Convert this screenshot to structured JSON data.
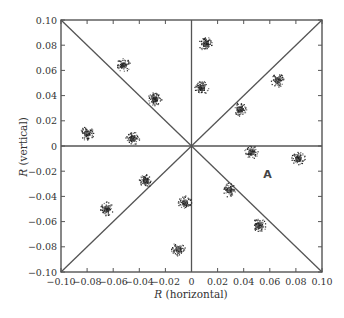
{
  "chart_data": {
    "type": "scatter",
    "title": "",
    "xlabel": "R (horizontal)",
    "ylabel": "R (vertical)",
    "xlabel_var": "R",
    "xlabel_rest": " (horizontal)",
    "ylabel_var": "R",
    "ylabel_rest": " (vertical)",
    "xlim": [
      -0.1,
      0.1
    ],
    "ylim": [
      -0.1,
      0.1
    ],
    "grid": false,
    "legend": null,
    "x_ticks": [
      "-0.10",
      "-0.08",
      "-0.06",
      "-0.04",
      "-0.02",
      "0",
      "0.02",
      "0.04",
      "0.06",
      "0.08",
      "0.10"
    ],
    "y_ticks": [
      "0.10",
      "0.08",
      "0.06",
      "0.04",
      "0.02",
      "0",
      "-0.02",
      "-0.04",
      "-0.06",
      "-0.08",
      "-0.10"
    ],
    "reference_lines": [
      {
        "type": "horizontal",
        "y": 0
      },
      {
        "type": "vertical",
        "x": 0
      },
      {
        "type": "diagonal",
        "from": [
          -0.1,
          -0.1
        ],
        "to": [
          0.1,
          0.1
        ]
      },
      {
        "type": "diagonal",
        "from": [
          -0.1,
          0.1
        ],
        "to": [
          0.1,
          -0.1
        ]
      }
    ],
    "clusters": [
      {
        "x": -0.08,
        "y": 0.01
      },
      {
        "x": -0.052,
        "y": 0.064
      },
      {
        "x": -0.028,
        "y": 0.037
      },
      {
        "x": -0.045,
        "y": 0.006
      },
      {
        "x": 0.011,
        "y": 0.081
      },
      {
        "x": 0.008,
        "y": 0.046
      },
      {
        "x": 0.037,
        "y": 0.029
      },
      {
        "x": 0.066,
        "y": 0.052
      },
      {
        "x": 0.046,
        "y": -0.005
      },
      {
        "x": 0.082,
        "y": -0.01
      },
      {
        "x": 0.029,
        "y": -0.035
      },
      {
        "x": 0.052,
        "y": -0.063
      },
      {
        "x": -0.005,
        "y": -0.045
      },
      {
        "x": -0.01,
        "y": -0.082
      },
      {
        "x": -0.035,
        "y": -0.028
      },
      {
        "x": -0.065,
        "y": -0.05
      }
    ],
    "annotations": [
      {
        "text": "A",
        "x": 0.055,
        "y": -0.022
      }
    ]
  }
}
